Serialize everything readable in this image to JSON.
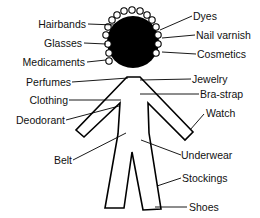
{
  "diagram": {
    "type": "body-contact-allergen-map",
    "colors": {
      "ink": "#000000",
      "background": "#ffffff"
    },
    "labels_left": [
      {
        "id": "hairbands",
        "text": "Hairbands"
      },
      {
        "id": "glasses",
        "text": "Glasses"
      },
      {
        "id": "medicaments",
        "text": "Medicaments"
      },
      {
        "id": "perfumes",
        "text": "Perfumes"
      },
      {
        "id": "clothing",
        "text": "Clothing"
      },
      {
        "id": "deodorant",
        "text": "Deodorant"
      },
      {
        "id": "belt",
        "text": "Belt"
      }
    ],
    "labels_right": [
      {
        "id": "dyes",
        "text": "Dyes"
      },
      {
        "id": "nail-varnish",
        "text": "Nail varnish"
      },
      {
        "id": "cosmetics",
        "text": "Cosmetics"
      },
      {
        "id": "jewelry",
        "text": "Jewelry"
      },
      {
        "id": "bra-strap",
        "text": "Bra-strap"
      },
      {
        "id": "watch",
        "text": "Watch"
      },
      {
        "id": "underwear",
        "text": "Underwear"
      },
      {
        "id": "stockings",
        "text": "Stockings"
      },
      {
        "id": "shoes",
        "text": "Shoes"
      }
    ]
  }
}
